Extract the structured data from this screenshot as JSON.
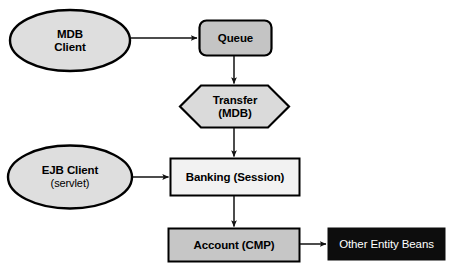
{
  "diagram": {
    "background_color": "#ffffff",
    "stroke_color": "#000000",
    "nodes": {
      "mdb_client": {
        "shape": "ellipse",
        "line1": "MDB",
        "line2": "Client",
        "fill": "#dedede",
        "text_color": "#000000"
      },
      "queue": {
        "shape": "rounded-rect",
        "line1": "Queue",
        "fill": "#c4c4c4",
        "text_color": "#000000"
      },
      "transfer": {
        "shape": "hexagon",
        "line1": "Transfer",
        "line2": "(MDB)",
        "fill": "#dadada",
        "text_color": "#000000"
      },
      "ejb_client": {
        "shape": "ellipse",
        "line1": "EJB Client",
        "line2": "(servlet)",
        "fill": "#dedede",
        "text_color": "#000000"
      },
      "banking": {
        "shape": "rect",
        "line1": "Banking (Session)",
        "fill": "#f2f2f2",
        "text_color": "#000000"
      },
      "account": {
        "shape": "rect",
        "line1": "Account (CMP)",
        "fill": "#c6c6c6",
        "text_color": "#000000"
      },
      "other_entity_beans": {
        "shape": "rect",
        "line1": "Other Entity Beans",
        "fill": "#0d0d0d",
        "text_color": "#ffffff"
      }
    },
    "connectors": [
      {
        "name": "mdb-client-to-queue",
        "from": "mdb_client",
        "to": "queue",
        "direction": "right"
      },
      {
        "name": "queue-to-transfer",
        "from": "queue",
        "to": "transfer",
        "direction": "down"
      },
      {
        "name": "transfer-to-banking",
        "from": "transfer",
        "to": "banking",
        "direction": "down"
      },
      {
        "name": "ejb-client-to-banking",
        "from": "ejb_client",
        "to": "banking",
        "direction": "right"
      },
      {
        "name": "banking-to-account",
        "from": "banking",
        "to": "account",
        "direction": "down"
      },
      {
        "name": "account-to-other-beans",
        "from": "account",
        "to": "other_entity_beans",
        "direction": "right"
      }
    ]
  }
}
